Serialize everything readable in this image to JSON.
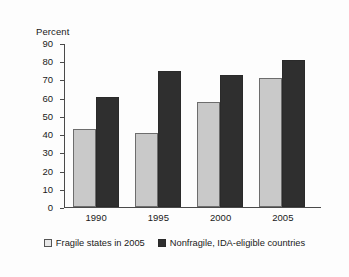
{
  "chart_data": {
    "type": "bar",
    "title": "",
    "xlabel": "",
    "ylabel": "Percent",
    "categories": [
      "1990",
      "1995",
      "2000",
      "2005"
    ],
    "ylim": [
      0,
      90
    ],
    "ytick_step": 10,
    "yticks": [
      "90",
      "80",
      "70",
      "60",
      "50",
      "40",
      "30",
      "20",
      "10",
      "0"
    ],
    "grid": false,
    "legend_position": "bottom",
    "series": [
      {
        "name": "Fragile states in 2005",
        "color": "#c9c9c9",
        "values": [
          43,
          41,
          58,
          71
        ]
      },
      {
        "name": "Nonfragile, IDA-eligible countries",
        "color": "#2f2f2f",
        "values": [
          61,
          75,
          73,
          81
        ]
      }
    ]
  },
  "legend": {
    "items": [
      {
        "label": "Fragile states in 2005",
        "swatch": "light-square-icon"
      },
      {
        "label": "Nonfragile, IDA-eligible countries",
        "swatch": "dark-square-icon"
      }
    ]
  },
  "colors": {
    "series_light": "#c9c9c9",
    "series_dark": "#2f2f2f",
    "axis": "#4a4a4a",
    "text": "#1a1a1a",
    "background": "#fdfdfd"
  }
}
